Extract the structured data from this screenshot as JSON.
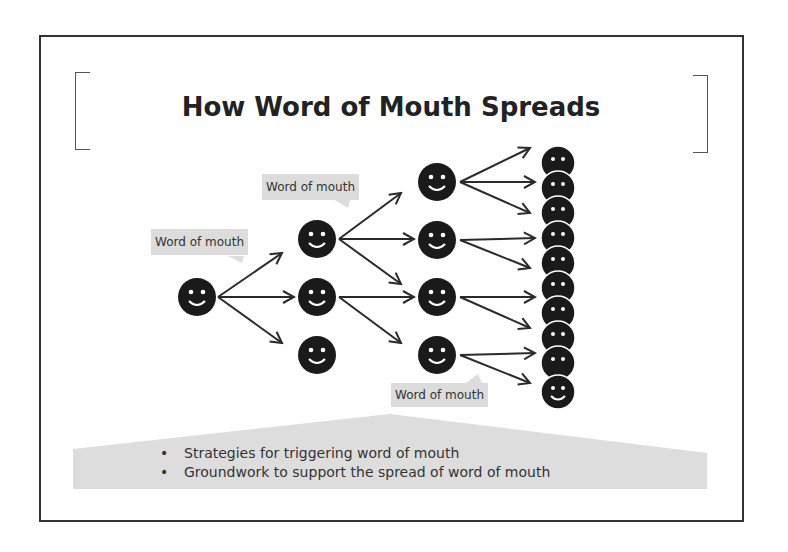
{
  "slide": {
    "title": "How Word of Mouth Spreads",
    "labels": [
      {
        "id": "label-1",
        "text": "Word of mouth"
      },
      {
        "id": "label-2",
        "text": "Word of mouth"
      },
      {
        "id": "label-3",
        "text": "Word of mouth"
      }
    ],
    "bullets": [
      "Strategies for triggering word of mouth",
      "Groundwork to support the spread of word of mouth"
    ],
    "diagram": {
      "node_icon": "smiley-face-icon",
      "columns": [
        {
          "name": "origin",
          "count": 1
        },
        {
          "name": "tier-2",
          "count": 3
        },
        {
          "name": "tier-3",
          "count": 4
        },
        {
          "name": "crowd",
          "count": 10
        }
      ],
      "colors": {
        "face": "#1a1a1a",
        "arrow": "#2a2a2a",
        "label_bg": "#dcdcdc",
        "callout_bg": "#dddddd",
        "frame": "#333333"
      }
    }
  }
}
